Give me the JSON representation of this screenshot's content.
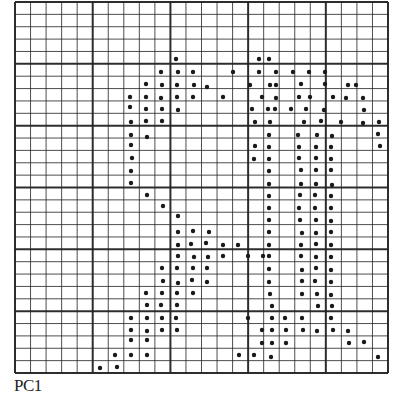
{
  "label": "PC1",
  "grid": {
    "left": 15,
    "top": 2,
    "right": 388,
    "bottom": 373,
    "cols": 24,
    "rows": 30,
    "major_every": 5,
    "line_color": "#222222",
    "dot_color": "#1a1a1a"
  },
  "dots": [
    [
      176,
      59
    ],
    [
      161,
      72
    ],
    [
      178,
      72
    ],
    [
      193,
      72
    ],
    [
      146,
      84
    ],
    [
      162,
      85
    ],
    [
      177,
      85
    ],
    [
      194,
      85
    ],
    [
      207,
      87
    ],
    [
      130,
      97
    ],
    [
      146,
      97
    ],
    [
      161,
      98
    ],
    [
      177,
      97
    ],
    [
      193,
      97
    ],
    [
      223,
      97
    ],
    [
      130,
      107
    ],
    [
      146,
      109
    ],
    [
      162,
      109
    ],
    [
      178,
      110
    ],
    [
      131,
      122
    ],
    [
      146,
      121
    ],
    [
      162,
      121
    ],
    [
      131,
      135
    ],
    [
      147,
      137
    ],
    [
      131,
      145
    ],
    [
      132,
      158
    ],
    [
      131,
      171
    ],
    [
      131,
      183
    ],
    [
      147,
      195
    ],
    [
      163,
      206
    ],
    [
      178,
      216
    ],
    [
      178,
      232
    ],
    [
      193,
      231
    ],
    [
      209,
      232
    ],
    [
      178,
      245
    ],
    [
      191,
      244
    ],
    [
      206,
      243
    ],
    [
      223,
      245
    ],
    [
      238,
      245
    ],
    [
      178,
      256
    ],
    [
      194,
      257
    ],
    [
      208,
      257
    ],
    [
      223,
      256
    ],
    [
      162,
      268
    ],
    [
      177,
      268
    ],
    [
      193,
      268
    ],
    [
      207,
      268
    ],
    [
      163,
      281
    ],
    [
      178,
      283
    ],
    [
      192,
      280
    ],
    [
      207,
      282
    ],
    [
      146,
      293
    ],
    [
      162,
      293
    ],
    [
      177,
      293
    ],
    [
      193,
      293
    ],
    [
      147,
      305
    ],
    [
      161,
      305
    ],
    [
      177,
      305
    ],
    [
      131,
      318
    ],
    [
      147,
      318
    ],
    [
      162,
      318
    ],
    [
      176,
      318
    ],
    [
      131,
      330
    ],
    [
      147,
      331
    ],
    [
      162,
      330
    ],
    [
      177,
      330
    ],
    [
      131,
      340
    ],
    [
      147,
      340
    ],
    [
      115,
      355
    ],
    [
      131,
      355
    ],
    [
      147,
      355
    ],
    [
      100,
      368
    ],
    [
      117,
      367
    ],
    [
      259,
      59
    ],
    [
      233,
      72
    ],
    [
      259,
      72
    ],
    [
      269,
      59
    ],
    [
      276,
      72
    ],
    [
      293,
      72
    ],
    [
      309,
      72
    ],
    [
      325,
      72
    ],
    [
      250,
      85
    ],
    [
      270,
      85
    ],
    [
      276,
      85
    ],
    [
      301,
      84
    ],
    [
      325,
      84
    ],
    [
      348,
      85
    ],
    [
      356,
      85
    ],
    [
      262,
      97
    ],
    [
      276,
      98
    ],
    [
      299,
      97
    ],
    [
      310,
      97
    ],
    [
      333,
      97
    ],
    [
      346,
      98
    ],
    [
      363,
      98
    ],
    [
      252,
      109
    ],
    [
      268,
      109
    ],
    [
      275,
      109
    ],
    [
      291,
      109
    ],
    [
      306,
      109
    ],
    [
      324,
      110
    ],
    [
      364,
      110
    ],
    [
      255,
      122
    ],
    [
      270,
      122
    ],
    [
      304,
      122
    ],
    [
      321,
      121
    ],
    [
      341,
      122
    ],
    [
      363,
      123
    ],
    [
      379,
      122
    ],
    [
      269,
      135
    ],
    [
      298,
      135
    ],
    [
      317,
      135
    ],
    [
      332,
      136
    ],
    [
      378,
      134
    ],
    [
      255,
      146
    ],
    [
      269,
      147
    ],
    [
      299,
      147
    ],
    [
      316,
      147
    ],
    [
      331,
      147
    ],
    [
      380,
      146
    ],
    [
      254,
      159
    ],
    [
      269,
      159
    ],
    [
      299,
      158
    ],
    [
      316,
      158
    ],
    [
      331,
      159
    ],
    [
      269,
      171
    ],
    [
      301,
      170
    ],
    [
      316,
      170
    ],
    [
      331,
      170
    ],
    [
      269,
      184
    ],
    [
      301,
      184
    ],
    [
      316,
      184
    ],
    [
      332,
      185
    ],
    [
      269,
      196
    ],
    [
      300,
      195
    ],
    [
      315,
      195
    ],
    [
      331,
      196
    ],
    [
      269,
      208
    ],
    [
      299,
      208
    ],
    [
      315,
      208
    ],
    [
      331,
      208
    ],
    [
      269,
      220
    ],
    [
      300,
      220
    ],
    [
      316,
      220
    ],
    [
      331,
      221
    ],
    [
      269,
      232
    ],
    [
      302,
      233
    ],
    [
      316,
      233
    ],
    [
      331,
      232
    ],
    [
      269,
      245
    ],
    [
      301,
      245
    ],
    [
      316,
      244
    ],
    [
      331,
      245
    ],
    [
      248,
      256
    ],
    [
      263,
      256
    ],
    [
      269,
      256
    ],
    [
      301,
      256
    ],
    [
      316,
      257
    ],
    [
      331,
      257
    ],
    [
      269,
      269
    ],
    [
      302,
      270
    ],
    [
      316,
      268
    ],
    [
      331,
      270
    ],
    [
      269,
      282
    ],
    [
      302,
      281
    ],
    [
      315,
      281
    ],
    [
      331,
      282
    ],
    [
      270,
      294
    ],
    [
      302,
      294
    ],
    [
      317,
      294
    ],
    [
      331,
      295
    ],
    [
      272,
      306
    ],
    [
      318,
      306
    ],
    [
      332,
      306
    ],
    [
      248,
      318
    ],
    [
      272,
      318
    ],
    [
      285,
      318
    ],
    [
      302,
      318
    ],
    [
      331,
      318
    ],
    [
      262,
      330
    ],
    [
      272,
      330
    ],
    [
      286,
      330
    ],
    [
      303,
      330
    ],
    [
      317,
      331
    ],
    [
      333,
      330
    ],
    [
      348,
      331
    ],
    [
      262,
      343
    ],
    [
      272,
      343
    ],
    [
      286,
      343
    ],
    [
      349,
      343
    ],
    [
      364,
      342
    ],
    [
      239,
      355
    ],
    [
      254,
      355
    ],
    [
      271,
      357
    ],
    [
      378,
      357
    ]
  ]
}
